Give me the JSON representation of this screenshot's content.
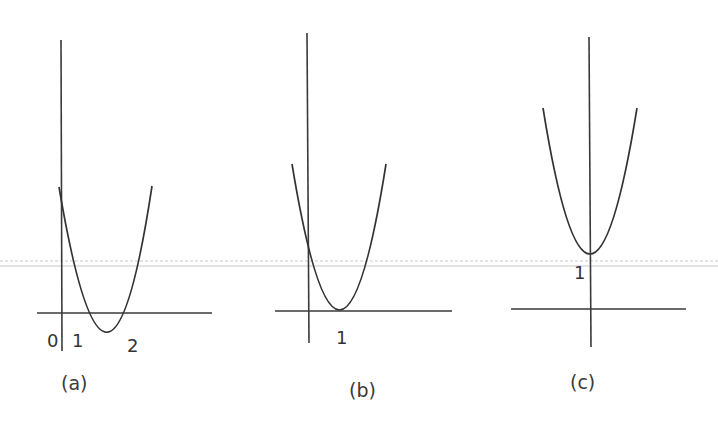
{
  "figure": {
    "panels": [
      {
        "id": "a",
        "caption": "(a)",
        "description": "Parabola opening upward with two x-intercepts between 1 and 2, vertex below the x-axis",
        "tick_labels": [
          "0",
          "1",
          "2"
        ]
      },
      {
        "id": "b",
        "caption": "(b)",
        "description": "Parabola opening upward tangent to the x-axis at x = 1",
        "tick_labels": [
          "1"
        ]
      },
      {
        "id": "c",
        "caption": "(c)",
        "description": "Parabola opening upward with vertex on the y-axis at y = 1, above the x-axis",
        "tick_labels": [
          "1"
        ]
      }
    ],
    "colors": {
      "stroke": "#333333",
      "background": "#ffffff"
    }
  }
}
